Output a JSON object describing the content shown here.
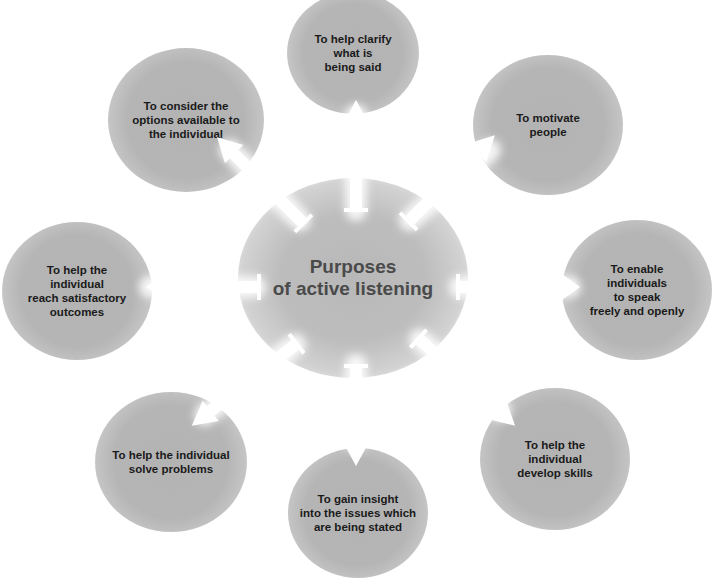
{
  "diagram": {
    "type": "hub-and-spoke",
    "center": {
      "title": "Purposes\nof active listening"
    },
    "nodes": [
      {
        "id": "top",
        "position": "top",
        "label": "To help clarify\nwhat is\nbeing said"
      },
      {
        "id": "top-right",
        "position": "top-right",
        "label": "To motivate\npeople"
      },
      {
        "id": "right",
        "position": "right",
        "label": "To enable\nindividuals\nto speak\nfreely and openly"
      },
      {
        "id": "bottom-right",
        "position": "bottom-right",
        "label": "To help the\nindividual\ndevelop skills"
      },
      {
        "id": "bottom",
        "position": "bottom",
        "label": "To gain insight\ninto the issues which\nare being stated"
      },
      {
        "id": "bottom-left",
        "position": "bottom-left",
        "label": "To help the individual\nsolve problems"
      },
      {
        "id": "left",
        "position": "left",
        "label": "To help the\nindividual\nreach satisfactory\noutcomes"
      },
      {
        "id": "top-left",
        "position": "top-left",
        "label": "To consider the\noptions available to\nthe individual"
      }
    ],
    "colors": {
      "background": "#ffffff",
      "node_fill": "#b5b5b5",
      "hub_fill": "#bdbdbd",
      "hub_text": "#4a4a4a",
      "node_text": "#1a1a1a",
      "arrow": "#ffffff"
    }
  }
}
